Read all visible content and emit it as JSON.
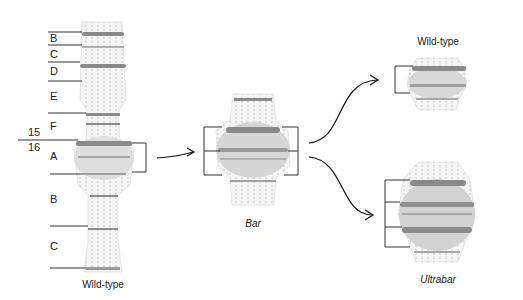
{
  "figure": {
    "wild_type_chromosome": {
      "caption": "Wild-type",
      "region_labels": [
        "B",
        "C",
        "D",
        "E",
        "F",
        "A",
        "B",
        "C"
      ],
      "section_labels": {
        "upper": "15",
        "lower": "16"
      }
    },
    "bar_chromosome": {
      "caption": "Bar"
    },
    "wild_type_result": {
      "caption": "Wild-type"
    },
    "ultrabar_result": {
      "caption": "Ultrabar"
    },
    "colors": {
      "band_dark": "#8a8a8a",
      "band_light": "#c8c8c8",
      "region_fill": "#dcdcdc",
      "line": "#333333"
    }
  }
}
